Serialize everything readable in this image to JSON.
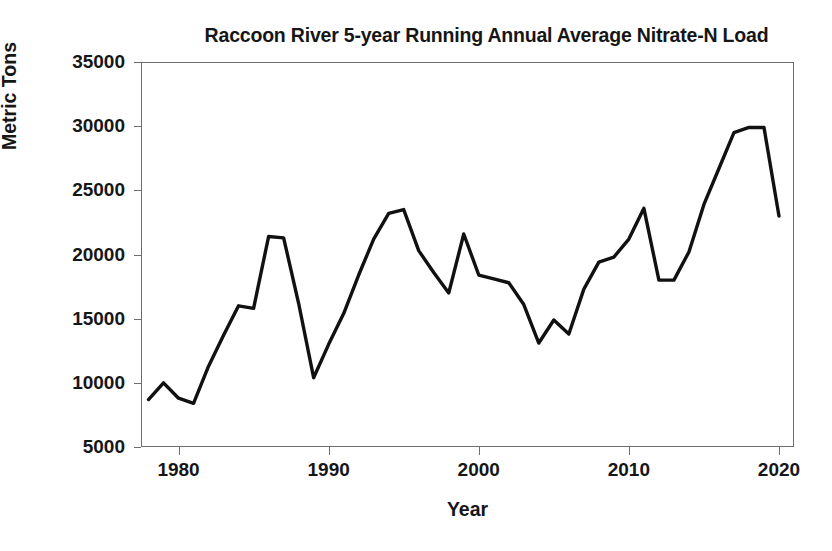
{
  "chart_data": {
    "type": "line",
    "title": "Raccoon River 5-year Running Annual Average Nitrate-N Load",
    "xlabel": "Year",
    "ylabel": "Metric Tons",
    "xlim": [
      1977.5,
      2021.0
    ],
    "ylim": [
      5000,
      35000
    ],
    "x_ticks": [
      1980,
      1990,
      2000,
      2010,
      2020
    ],
    "y_ticks": [
      5000,
      10000,
      15000,
      20000,
      25000,
      30000,
      35000
    ],
    "grid": false,
    "legend": null,
    "line_color": "#111111",
    "line_width": 3.4,
    "x": [
      1978,
      1979,
      1980,
      1981,
      1982,
      1983,
      1984,
      1985,
      1986,
      1987,
      1988,
      1989,
      1990,
      1991,
      1992,
      1993,
      1994,
      1995,
      1996,
      1997,
      1998,
      1999,
      2000,
      2001,
      2002,
      2003,
      2004,
      2005,
      2006,
      2007,
      2008,
      2009,
      2010,
      2011,
      2012,
      2013,
      2014,
      2015,
      2016,
      2017,
      2018,
      2019,
      2020
    ],
    "values": [
      8700,
      10000,
      8800,
      8400,
      11300,
      13700,
      16000,
      15800,
      21400,
      21300,
      16200,
      10400,
      13000,
      15400,
      18400,
      21200,
      23200,
      23500,
      20300,
      18600,
      17000,
      21600,
      18400,
      18100,
      17800,
      16100,
      13100,
      14900,
      13800,
      17300,
      19400,
      19800,
      21200,
      23600,
      18000,
      18000,
      20200,
      23900,
      26700,
      29500,
      29900,
      29900,
      23000
    ],
    "series": [
      {
        "name": "5-year running annual average nitrate-N load",
        "values": [
          8700,
          10000,
          8800,
          8400,
          11300,
          13700,
          16000,
          15800,
          21400,
          21300,
          16200,
          10400,
          13000,
          15400,
          18400,
          21200,
          23200,
          23500,
          20300,
          18600,
          17000,
          21600,
          18400,
          18100,
          17800,
          16100,
          13100,
          14900,
          13800,
          17300,
          19400,
          19800,
          21200,
          23600,
          18000,
          18000,
          20200,
          23900,
          26700,
          29500,
          29900,
          29900,
          23000
        ]
      }
    ]
  },
  "axis": {
    "y_tick_labels": [
      "35000",
      "30000",
      "25000",
      "20000",
      "15000",
      "10000",
      "5000"
    ],
    "x_tick_labels": [
      "1980",
      "1990",
      "2000",
      "2010",
      "2020"
    ]
  }
}
